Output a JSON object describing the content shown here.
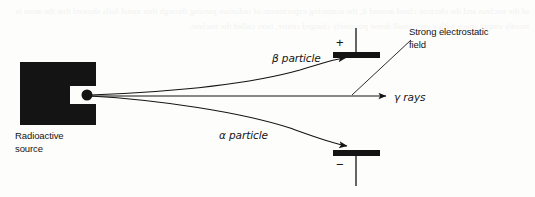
{
  "figure": {
    "background_color": "#fdfdfc",
    "ink_color": "#141414",
    "labels": {
      "source_line1": "Radioactive",
      "source_line2": "source",
      "beta_particle": "β particle",
      "alpha_particle": "α particle",
      "gamma_rays": "γ rays",
      "field_line1": "Strong electrostatic",
      "field_line2": "field",
      "plus_sign": "+",
      "minus_sign": "−"
    },
    "elements": {
      "source_block": {
        "name": "radioactive-source-block",
        "shape": "c-shaped-block",
        "fill": "#141414",
        "x": 20,
        "y": 62,
        "width": 76,
        "height": 63
      },
      "aperture_dot": {
        "name": "aperture-dot",
        "cx": 87,
        "cy": 95,
        "r": 5.5,
        "fill": "#141414"
      },
      "positive_plate": {
        "name": "positive-plate",
        "x": 333,
        "y": 52,
        "width": 47,
        "height": 6,
        "stem_x": 356,
        "stem_top": 28,
        "stem_bottom": 52
      },
      "negative_plate": {
        "name": "negative-plate",
        "x": 333,
        "y": 150,
        "width": 47,
        "height": 6,
        "stem_x": 356,
        "stem_top": 156,
        "stem_bottom": 186
      },
      "beta_path": {
        "name": "beta-particle-path",
        "description": "curves upward toward the positive plate",
        "start": [
          90,
          95
        ],
        "end": [
          348,
          57
        ]
      },
      "alpha_path": {
        "name": "alpha-particle-path",
        "description": "curves downward toward the negative plate",
        "start": [
          90,
          95
        ],
        "end": [
          349,
          148
        ]
      },
      "gamma_path": {
        "name": "gamma-rays-path",
        "description": "straight undeflected horizontal line with arrowhead",
        "start": [
          90,
          96
        ],
        "end": [
          391,
          96
        ]
      },
      "field_leader_line": {
        "name": "field-leader-line",
        "start": [
          352,
          94
        ],
        "end": [
          411,
          40
        ]
      }
    },
    "bleed_through_text": "of the nucleus and the electron cloud around it, the scattering experiments of radiation passing through thin metal foils showed that the atom is mostly empty space with a very small dense positively charged centre, later called the nucleus."
  }
}
